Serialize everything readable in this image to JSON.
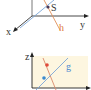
{
  "top_panel": {
    "labels": {
      "x": "x",
      "y": "y",
      "h": "h",
      "S": "S"
    },
    "colors": {
      "axis": "#333333",
      "line_h": "#e0905a",
      "line_blue": "#7aa6d8",
      "point_S": "#4a3a5a",
      "label_h": "#e07a3a"
    }
  },
  "bottom_panel": {
    "labels": {
      "z": "z",
      "g": "g"
    },
    "colors": {
      "background": "#fdf6e0",
      "axis": "#222222",
      "line_orange": "#d9896a",
      "line_g": "#7aa6d8",
      "point_red": "#e04a3a",
      "point_blue": "#3a8ad0",
      "label_g": "#4a8ad0"
    }
  }
}
